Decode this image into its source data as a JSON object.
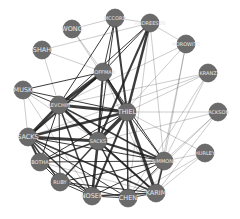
{
  "diagram": {
    "type": "network-graph",
    "node_color": "#6b6b6b",
    "label_color": "#e8e8e8",
    "edge_color": "#1a1a1a",
    "nodes": [
      {
        "id": "mccord",
        "label": "MCCORD",
        "x": 115,
        "y": 18,
        "r": 9
      },
      {
        "id": "andreessen",
        "label": "ANDREESEN",
        "x": 150,
        "y": 23,
        "r": 9
      },
      {
        "id": "wong",
        "label": "WONG",
        "x": 72,
        "y": 29,
        "r": 9
      },
      {
        "id": "horowitz",
        "label": "HOROWITZ",
        "x": 186,
        "y": 44,
        "r": 9
      },
      {
        "id": "shah",
        "label": "SHAH",
        "x": 42,
        "y": 50,
        "r": 9
      },
      {
        "id": "kranz",
        "label": "KRANZ",
        "x": 208,
        "y": 73,
        "r": 9
      },
      {
        "id": "hoffman",
        "label": "HOFFMAN",
        "x": 103,
        "y": 72,
        "r": 9
      },
      {
        "id": "musk",
        "label": "MUSK",
        "x": 23,
        "y": 90,
        "r": 9
      },
      {
        "id": "levchin",
        "label": "LEVCHIN",
        "x": 59,
        "y": 105,
        "r": 9
      },
      {
        "id": "thiel",
        "label": "THIEL",
        "x": 127,
        "y": 112,
        "r": 9
      },
      {
        "id": "jackson",
        "label": "JACKSON",
        "x": 218,
        "y": 112,
        "r": 9
      },
      {
        "id": "sacks",
        "label": "SACKS",
        "x": 28,
        "y": 137,
        "r": 9
      },
      {
        "id": "sacks2",
        "label": "SACKS",
        "x": 98,
        "y": 141,
        "r": 9
      },
      {
        "id": "botha",
        "label": "BOTHA",
        "x": 40,
        "y": 162,
        "r": 9
      },
      {
        "id": "simmons",
        "label": "SIMMONS",
        "x": 164,
        "y": 161,
        "r": 9
      },
      {
        "id": "hurley",
        "label": "HURLEY",
        "x": 205,
        "y": 153,
        "r": 9
      },
      {
        "id": "ruby",
        "label": "RUBY",
        "x": 60,
        "y": 182,
        "r": 9
      },
      {
        "id": "karim",
        "label": "KARIM",
        "x": 156,
        "y": 193,
        "r": 9
      },
      {
        "id": "nosek",
        "label": "NOSEK",
        "x": 92,
        "y": 196,
        "r": 9
      },
      {
        "id": "chen",
        "label": "CHEN",
        "x": 128,
        "y": 198,
        "r": 9
      }
    ],
    "edges": [
      [
        "mccord",
        "hoffman",
        1
      ],
      [
        "mccord",
        "thiel",
        2
      ],
      [
        "mccord",
        "levchin",
        1
      ],
      [
        "mccord",
        "andreessen",
        0.5
      ],
      [
        "mccord",
        "sacks2",
        1
      ],
      [
        "andreessen",
        "hoffman",
        1
      ],
      [
        "andreessen",
        "thiel",
        2.5
      ],
      [
        "andreessen",
        "sacks2",
        2
      ],
      [
        "andreessen",
        "levchin",
        1
      ],
      [
        "andreessen",
        "horowitz",
        0.5
      ],
      [
        "andreessen",
        "simmons",
        0.5
      ],
      [
        "andreessen",
        "chen",
        0.5
      ],
      [
        "wong",
        "hoffman",
        0.5
      ],
      [
        "wong",
        "thiel",
        0.5
      ],
      [
        "wong",
        "mccord",
        0.5
      ],
      [
        "shah",
        "andreessen",
        0.5
      ],
      [
        "shah",
        "hoffman",
        0.5
      ],
      [
        "shah",
        "levchin",
        0.5
      ],
      [
        "horowitz",
        "levchin",
        0.5
      ],
      [
        "horowitz",
        "simmons",
        0.5
      ],
      [
        "horowitz",
        "karim",
        0.5
      ],
      [
        "horowitz",
        "sacks2",
        0.5
      ],
      [
        "kranz",
        "thiel",
        0.5
      ],
      [
        "kranz",
        "sacks",
        0.5
      ],
      [
        "kranz",
        "levchin",
        0.5
      ],
      [
        "kranz",
        "simmons",
        0.5
      ],
      [
        "kranz",
        "chen",
        0.5
      ],
      [
        "hoffman",
        "levchin",
        3
      ],
      [
        "hoffman",
        "thiel",
        2.5
      ],
      [
        "hoffman",
        "sacks",
        2
      ],
      [
        "hoffman",
        "sacks2",
        2
      ],
      [
        "hoffman",
        "musk",
        1
      ],
      [
        "hoffman",
        "simmons",
        1
      ],
      [
        "hoffman",
        "karim",
        0.5
      ],
      [
        "musk",
        "levchin",
        1
      ],
      [
        "musk",
        "thiel",
        1
      ],
      [
        "musk",
        "sacks",
        0.5
      ],
      [
        "musk",
        "sacks2",
        0.5
      ],
      [
        "musk",
        "nosek",
        0.5
      ],
      [
        "levchin",
        "thiel",
        3
      ],
      [
        "levchin",
        "sacks",
        3
      ],
      [
        "levchin",
        "sacks2",
        3
      ],
      [
        "levchin",
        "nosek",
        1.5
      ],
      [
        "levchin",
        "ruby",
        1
      ],
      [
        "levchin",
        "simmons",
        1.5
      ],
      [
        "levchin",
        "karim",
        1
      ],
      [
        "levchin",
        "botha",
        1
      ],
      [
        "thiel",
        "sacks",
        2.5
      ],
      [
        "thiel",
        "sacks2",
        3.5
      ],
      [
        "thiel",
        "simmons",
        1
      ],
      [
        "thiel",
        "karim",
        3
      ],
      [
        "thiel",
        "nosek",
        2
      ],
      [
        "thiel",
        "chen",
        1.5
      ],
      [
        "thiel",
        "jackson",
        0.5
      ],
      [
        "thiel",
        "botha",
        1
      ],
      [
        "jackson",
        "simmons",
        0.5
      ],
      [
        "jackson",
        "sacks2",
        0.5
      ],
      [
        "jackson",
        "chen",
        0.5
      ],
      [
        "jackson",
        "karim",
        0.5
      ],
      [
        "sacks",
        "sacks2",
        3
      ],
      [
        "sacks",
        "botha",
        2
      ],
      [
        "sacks",
        "ruby",
        1.5
      ],
      [
        "sacks",
        "nosek",
        1.5
      ],
      [
        "sacks",
        "karim",
        1.5
      ],
      [
        "sacks",
        "simmons",
        1
      ],
      [
        "sacks",
        "chen",
        1
      ],
      [
        "sacks2",
        "simmons",
        2
      ],
      [
        "sacks2",
        "karim",
        2
      ],
      [
        "sacks2",
        "nosek",
        2.5
      ],
      [
        "sacks2",
        "chen",
        1.5
      ],
      [
        "sacks2",
        "ruby",
        1.5
      ],
      [
        "sacks2",
        "botha",
        1.5
      ],
      [
        "botha",
        "ruby",
        1
      ],
      [
        "botha",
        "nosek",
        1
      ],
      [
        "botha",
        "simmons",
        1
      ],
      [
        "botha",
        "karim",
        0.5
      ],
      [
        "simmons",
        "karim",
        1.5
      ],
      [
        "simmons",
        "hurley",
        0.5
      ],
      [
        "simmons",
        "chen",
        1
      ],
      [
        "simmons",
        "nosek",
        1
      ],
      [
        "simmons",
        "ruby",
        1
      ],
      [
        "hurley",
        "karim",
        0.5
      ],
      [
        "hurley",
        "chen",
        0.5
      ],
      [
        "hurley",
        "thiel",
        0.5
      ],
      [
        "ruby",
        "nosek",
        1
      ],
      [
        "ruby",
        "karim",
        1
      ],
      [
        "ruby",
        "chen",
        1
      ],
      [
        "nosek",
        "karim",
        1.5
      ],
      [
        "nosek",
        "chen",
        1
      ],
      [
        "karim",
        "chen",
        1
      ]
    ]
  }
}
